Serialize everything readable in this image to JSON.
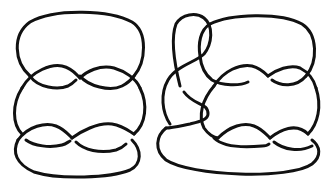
{
  "figure": {
    "type": "knot-diagrams",
    "background": "#ffffff",
    "stroke_color": "#111111",
    "panels": [
      {
        "id": "left",
        "description": "Knot diagram built from two stacked twisted loops (closed braid-like form), 4 visible crossings in two twist regions"
      },
      {
        "id": "right",
        "description": "Same knot with an additional Reidemeister-style loop on the upper left forming extra crossings"
      }
    ]
  }
}
